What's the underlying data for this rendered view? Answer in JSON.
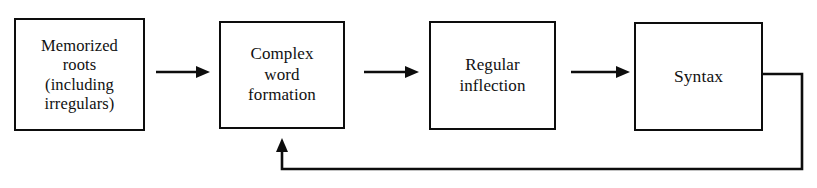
{
  "figure": {
    "type": "flowchart",
    "orientation": "left-to-right",
    "background_color": "#ffffff",
    "line_color": "#0d0d0d",
    "text_color": "#111111"
  },
  "stages": [
    {
      "id": "memorized-roots",
      "label": "Memorized\nroots\n(including\nirregulars)"
    },
    {
      "id": "complex-word-formation",
      "label": "Complex\nword\nformation"
    },
    {
      "id": "regular-inflection",
      "label": "Regular\ninflection"
    },
    {
      "id": "syntax",
      "label": "Syntax"
    }
  ],
  "connectors": [
    {
      "id": "arrow-roots-to-word-formation",
      "icon": "right-arrow-icon",
      "from": "memorized-roots",
      "to": "complex-word-formation"
    },
    {
      "id": "arrow-word-formation-to-inflection",
      "icon": "right-arrow-icon",
      "from": "complex-word-formation",
      "to": "regular-inflection"
    },
    {
      "id": "arrow-inflection-to-syntax",
      "icon": "right-arrow-icon",
      "from": "regular-inflection",
      "to": "syntax"
    },
    {
      "id": "feedback-syntax-to-word-formation",
      "icon": "up-arrow-icon",
      "from": "syntax",
      "to": "complex-word-formation",
      "path": "right-down-left-up"
    }
  ]
}
